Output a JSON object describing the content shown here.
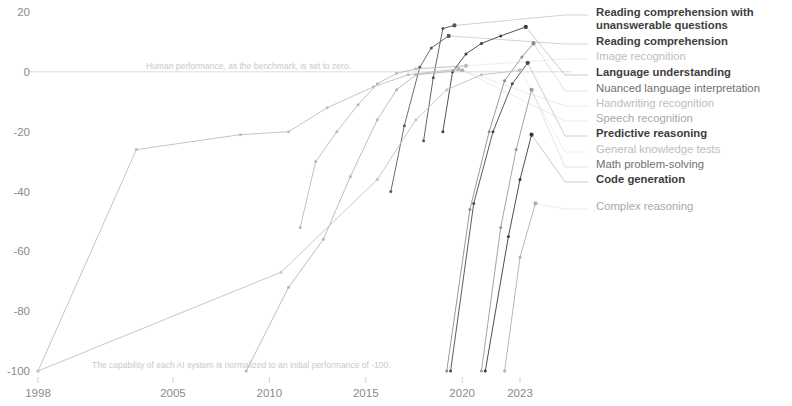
{
  "chart_data": {
    "type": "line",
    "title": "",
    "xlabel": "",
    "ylabel": "",
    "xlim": [
      1998,
      2024
    ],
    "ylim": [
      -100,
      20
    ],
    "grid": false,
    "legend_position": "right",
    "x_ticks": [
      "1998",
      "2005",
      "2010",
      "2015",
      "2020",
      "2023"
    ],
    "x_tick_values": [
      1998,
      2005,
      2010,
      2015,
      2020,
      2023
    ],
    "y_ticks": [
      "20",
      "0",
      "-20",
      "-40",
      "-60",
      "-80",
      "-100"
    ],
    "y_tick_values": [
      20,
      0,
      -20,
      -40,
      -60,
      -80,
      -100
    ],
    "annotations": [
      {
        "text": "Human performance, as the benchmark, is set to zero.",
        "x": 2003.6,
        "y": 0
      },
      {
        "text": "The capability of each AI system is normalized to an initial performance of -100.",
        "x": 2000.8,
        "y": -100
      }
    ],
    "series": [
      {
        "name": "Reading comprehension with unanswerable questions",
        "color": "#555555",
        "emphasis": "dark",
        "points": [
          {
            "x": 2018.0,
            "y": -23.0
          },
          {
            "x": 2018.5,
            "y": -2.0
          },
          {
            "x": 2019.0,
            "y": 14.5
          },
          {
            "x": 2019.6,
            "y": 15.5
          }
        ]
      },
      {
        "name": "Reading comprehension",
        "color": "#5c5c5c",
        "emphasis": "dark",
        "points": [
          {
            "x": 2016.3,
            "y": -40.0
          },
          {
            "x": 2017.0,
            "y": -18.0
          },
          {
            "x": 2017.8,
            "y": 1.5
          },
          {
            "x": 2018.4,
            "y": 8.0
          },
          {
            "x": 2019.3,
            "y": 12.0
          }
        ]
      },
      {
        "name": "Image recognition",
        "color": "#b9b9b9",
        "emphasis": "vlight",
        "points": [
          {
            "x": 2011.6,
            "y": -52.0
          },
          {
            "x": 2012.4,
            "y": -30.0
          },
          {
            "x": 2013.5,
            "y": -20.0
          },
          {
            "x": 2014.6,
            "y": -11.0
          },
          {
            "x": 2015.6,
            "y": -4.0
          },
          {
            "x": 2016.6,
            "y": -0.5
          },
          {
            "x": 2017.6,
            "y": 1.0
          },
          {
            "x": 2020.2,
            "y": 2.0
          }
        ]
      },
      {
        "name": "Language understanding",
        "color": "#3d3d3d",
        "emphasis": "dark",
        "points": [
          {
            "x": 2019.0,
            "y": -20.0
          },
          {
            "x": 2019.5,
            "y": 0.0
          },
          {
            "x": 2020.2,
            "y": 6.0
          },
          {
            "x": 2021.0,
            "y": 9.5
          },
          {
            "x": 2022.0,
            "y": 12.0
          },
          {
            "x": 2023.3,
            "y": 15.0
          }
        ]
      },
      {
        "name": "Nuanced language interpretation",
        "color": "#8e8e8e",
        "emphasis": "mid",
        "points": [
          {
            "x": 2019.2,
            "y": -100.0
          },
          {
            "x": 2020.4,
            "y": -46.0
          },
          {
            "x": 2021.4,
            "y": -20.0
          },
          {
            "x": 2022.2,
            "y": -3.0
          },
          {
            "x": 2023.1,
            "y": 5.0
          },
          {
            "x": 2023.7,
            "y": 9.5
          }
        ]
      },
      {
        "name": "Handwriting recognition",
        "color": "#bdbdbd",
        "emphasis": "vlight",
        "points": [
          {
            "x": 1998.0,
            "y": -100.0
          },
          {
            "x": 2003.1,
            "y": -26.0
          },
          {
            "x": 2008.5,
            "y": -21.0
          },
          {
            "x": 2011.0,
            "y": -20.0
          },
          {
            "x": 2013.0,
            "y": -12.0
          },
          {
            "x": 2015.4,
            "y": -5.0
          },
          {
            "x": 2017.2,
            "y": -1.0
          },
          {
            "x": 2019.8,
            "y": 1.0
          }
        ]
      },
      {
        "name": "Speech recognition",
        "color": "#b5b5b5",
        "emphasis": "light",
        "points": [
          {
            "x": 2008.8,
            "y": -100.0
          },
          {
            "x": 2011.0,
            "y": -72.0
          },
          {
            "x": 2012.8,
            "y": -56.0
          },
          {
            "x": 2014.2,
            "y": -35.0
          },
          {
            "x": 2015.6,
            "y": -16.0
          },
          {
            "x": 2016.6,
            "y": -6.0
          },
          {
            "x": 2017.6,
            "y": -1.0
          },
          {
            "x": 2020.0,
            "y": 0.5
          }
        ]
      },
      {
        "name": "Predictive reasoning",
        "color": "#4a4a4a",
        "emphasis": "dark",
        "points": [
          {
            "x": 2019.4,
            "y": -100.0
          },
          {
            "x": 2020.6,
            "y": -44.0
          },
          {
            "x": 2021.6,
            "y": -20.0
          },
          {
            "x": 2022.6,
            "y": -4.0
          },
          {
            "x": 2023.4,
            "y": 3.0
          }
        ]
      },
      {
        "name": "General knowledge tests",
        "color": "#c2c2c2",
        "emphasis": "vlight",
        "points": [
          {
            "x": 1998.0,
            "y": -100.0
          },
          {
            "x": 2010.6,
            "y": -67.0
          },
          {
            "x": 2015.6,
            "y": -36.0
          },
          {
            "x": 2017.6,
            "y": -16.0
          },
          {
            "x": 2019.2,
            "y": -6.0
          },
          {
            "x": 2021.0,
            "y": -1.0
          },
          {
            "x": 2023.0,
            "y": 0.5
          }
        ]
      },
      {
        "name": "Math problem-solving",
        "color": "#9a9a9a",
        "emphasis": "mid",
        "points": [
          {
            "x": 2021.0,
            "y": -100.0
          },
          {
            "x": 2022.0,
            "y": -52.0
          },
          {
            "x": 2022.8,
            "y": -26.0
          },
          {
            "x": 2023.6,
            "y": -6.0
          }
        ]
      },
      {
        "name": "Code generation",
        "color": "#3a3a3a",
        "emphasis": "dark",
        "points": [
          {
            "x": 2021.2,
            "y": -100.0
          },
          {
            "x": 2022.4,
            "y": -55.0
          },
          {
            "x": 2023.0,
            "y": -36.0
          },
          {
            "x": 2023.6,
            "y": -21.0
          }
        ]
      },
      {
        "name": "Complex reasoning",
        "color": "#b0b0b0",
        "emphasis": "light",
        "points": [
          {
            "x": 2022.2,
            "y": -100.0
          },
          {
            "x": 2023.0,
            "y": -62.0
          },
          {
            "x": 2023.8,
            "y": -44.0
          }
        ]
      }
    ]
  },
  "legend": {
    "items": [
      {
        "label": "Reading comprehension with",
        "label2": "unanswerable questions",
        "style": "lg-dark",
        "y": 6
      },
      {
        "label": "Reading comprehension",
        "style": "lg-dark",
        "y": 35
      },
      {
        "label": "Image recognition",
        "style": "lg-vlight",
        "y": 50
      },
      {
        "label": "Language understanding",
        "style": "lg-dark",
        "y": 66
      },
      {
        "label": "Nuanced language interpretation",
        "style": "lg-mid",
        "y": 82
      },
      {
        "label": "Handwriting recognition",
        "style": "lg-vlight",
        "y": 97
      },
      {
        "label": "Speech recognition",
        "style": "lg-light",
        "y": 112
      },
      {
        "label": "Predictive reasoning",
        "style": "lg-dark",
        "y": 127
      },
      {
        "label": "General knowledge tests",
        "style": "lg-vlight",
        "y": 143
      },
      {
        "label": "Math problem-solving",
        "style": "lg-mid",
        "y": 158
      },
      {
        "label": "Code generation",
        "style": "lg-dark",
        "y": 173
      },
      {
        "label": "Complex reasoning",
        "style": "lg-light",
        "y": 200
      }
    ]
  }
}
